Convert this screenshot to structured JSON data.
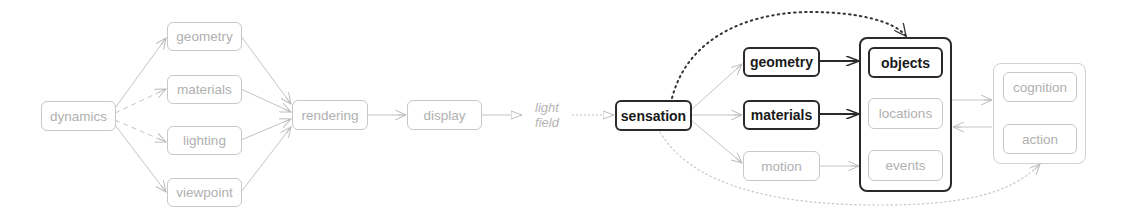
{
  "colors": {
    "faint_stroke": "#c0c0c0",
    "faint_text": "#b0b0b0",
    "bold_stroke": "#2a2a2a",
    "bold_text": "#1a1a1a",
    "background": "#ffffff"
  },
  "generative": {
    "dynamics": "dynamics",
    "geometry": "geometry",
    "materials": "materials",
    "lighting": "lighting",
    "viewpoint": "viewpoint",
    "rendering": "rendering",
    "display": "display",
    "light_field_line1": "light",
    "light_field_line2": "field"
  },
  "perception": {
    "sensation": "sensation",
    "geometry": "geometry",
    "materials": "materials",
    "motion": "motion",
    "objects": "objects",
    "locations": "locations",
    "events": "events",
    "cognition": "cognition",
    "action": "action"
  }
}
